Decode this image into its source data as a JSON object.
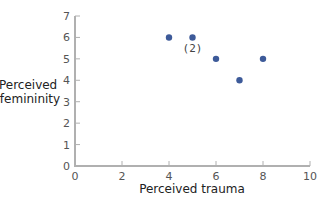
{
  "chart_data": {
    "type": "scatter",
    "title": "",
    "xlabel": "Perceived trauma",
    "ylabel": "Perceived femininity",
    "ylabel_lines": [
      "Perceived",
      "femininity"
    ],
    "xlim": [
      0,
      10
    ],
    "ylim": [
      0,
      7
    ],
    "xticks": [
      0,
      2,
      4,
      6,
      8,
      10
    ],
    "yticks": [
      0,
      1,
      2,
      3,
      4,
      5,
      6,
      7
    ],
    "grid": false,
    "legend": null,
    "points": [
      {
        "x": 4,
        "y": 6
      },
      {
        "x": 5,
        "y": 6,
        "count": 2,
        "label": "(2)"
      },
      {
        "x": 6,
        "y": 5
      },
      {
        "x": 7,
        "y": 4
      },
      {
        "x": 8,
        "y": 5
      }
    ],
    "annotations": [
      {
        "x": 5,
        "y": 6,
        "text": "(2)",
        "position": "below"
      }
    ],
    "colors": {
      "point": "#3d5a99",
      "axis": "#b0b0b0"
    }
  }
}
